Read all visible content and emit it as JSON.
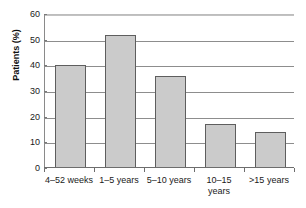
{
  "chart_data": {
    "type": "bar",
    "title": "",
    "xlabel": "",
    "ylabel": "Patients (%)",
    "ylim": [
      0,
      60
    ],
    "yticks": [
      "0",
      "10",
      "20",
      "30",
      "40",
      "50",
      "60"
    ],
    "grid": "horizontal",
    "legend": "none",
    "categories": [
      "4–52 weeks",
      "1–5 years",
      "5–10 years",
      "10–15 years",
      ">15 years"
    ],
    "category_lines": [
      [
        "4–52 weeks"
      ],
      [
        "1–5 years"
      ],
      [
        "5–10 years"
      ],
      [
        "10–15",
        "years"
      ],
      [
        ">15 years"
      ]
    ],
    "values": [
      40,
      52,
      36,
      17,
      14
    ],
    "bar_fill": "#cbcbcb",
    "bar_stroke": "#5e5e5e",
    "background": "#ffffff",
    "gridline_color": "#8d8d8d"
  }
}
